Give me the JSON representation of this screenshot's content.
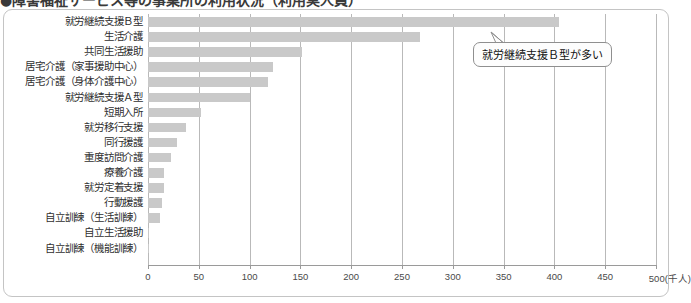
{
  "title": "●障害福祉サービス等の事業所の利用状況（利用実人員）",
  "axis_unit_label": "(千人)",
  "callout": {
    "text": "就労継続支援Ｂ型が多い"
  },
  "chart_data": {
    "type": "bar",
    "orientation": "horizontal",
    "title": "●障害福祉サービス等の事業所の利用状況（利用実人員）",
    "xlabel": "(千人)",
    "ylabel": "",
    "xlim": [
      0,
      500
    ],
    "grid": true,
    "legend": false,
    "tick_labels": [
      "0",
      "50",
      "100",
      "150",
      "200",
      "250",
      "300",
      "350",
      "400",
      "450",
      "500(千人)"
    ],
    "ticks": [
      0,
      50,
      100,
      150,
      200,
      250,
      300,
      350,
      400,
      450,
      500
    ],
    "categories": [
      "就労継続支援Ｂ型",
      "生活介護",
      "共同生活援助",
      "居宅介護（家事援助中心）",
      "居宅介護（身体介護中心）",
      "就労継続支援Ａ型",
      "短期入所",
      "就労移行支援",
      "同行援護",
      "重度訪問介護",
      "療養介護",
      "就労定着支援",
      "行動援護",
      "自立訓練（生活訓練）",
      "自立生活援助",
      "自立訓練（機能訓練）"
    ],
    "values": [
      405,
      268,
      152,
      123,
      118,
      100,
      52,
      37,
      29,
      23,
      16,
      16,
      14,
      12,
      1,
      1
    ],
    "bar_color": "#c9c9c9",
    "annotations": [
      {
        "text": "就労継続支援Ｂ型が多い",
        "points_to_category": "就労継続支援Ｂ型"
      }
    ]
  }
}
